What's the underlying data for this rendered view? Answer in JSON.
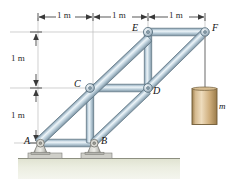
{
  "figure": {
    "colors": {
      "member_light": "#e3edf3",
      "member_mid": "#a9c0ce",
      "member_dark": "#7d95a5",
      "member_edge": "#5d7381",
      "joint_fill": "#c9d6de",
      "support_light": "#e8e8e6",
      "support_mid": "#b9b9b4",
      "support_dark": "#8d8d88",
      "ground_fill": "#e5e7d8",
      "ground_line": "#8d8f80",
      "cylinder_light": "#e2cba4",
      "cylinder_mid": "#c9a873",
      "cylinder_dark": "#9d7f4e",
      "cable": "#8c8c8c",
      "grid_line": "#b9b9b9",
      "dim_line": "#3a3a3a",
      "text": "#111111"
    }
  },
  "dimensions": {
    "horizontal": [
      {
        "label": "1 m",
        "x": 65,
        "y": 9
      },
      {
        "label": "1 m",
        "x": 122,
        "y": 9
      },
      {
        "label": "1 m",
        "x": 179,
        "y": 9
      }
    ],
    "vertical": [
      {
        "label": "1 m",
        "x": 15,
        "y": 55
      },
      {
        "label": "1 m",
        "x": 15,
        "y": 112
      }
    ]
  },
  "joints": [
    {
      "name": "A",
      "label": "A",
      "x": 38,
      "y": 143,
      "label_x": 25,
      "label_y": 137,
      "type": "pin-support"
    },
    {
      "name": "B",
      "label": "B",
      "x": 93,
      "y": 143,
      "label_x": 102,
      "label_y": 137,
      "type": "pin-support"
    },
    {
      "name": "C",
      "label": "C",
      "x": 90,
      "y": 88,
      "label_x": 75,
      "label_y": 81,
      "type": "pin-joint"
    },
    {
      "name": "D",
      "label": "D",
      "x": 148,
      "y": 88,
      "label_x": 155,
      "label_y": 85,
      "type": "pin-joint"
    },
    {
      "name": "E",
      "label": "E",
      "x": 148,
      "y": 32,
      "label_x": 133,
      "label_y": 25,
      "type": "pin-joint"
    },
    {
      "name": "F",
      "label": "F",
      "x": 205,
      "y": 32,
      "label_x": 213,
      "label_y": 25,
      "type": "pin-joint"
    }
  ],
  "members": [
    {
      "name": "member-A-E",
      "from": "A",
      "to": "E"
    },
    {
      "name": "member-E-F",
      "from": "E",
      "to": "F"
    },
    {
      "name": "member-A-B",
      "from": "A",
      "to": "B"
    },
    {
      "name": "member-B-D",
      "from": "B",
      "to": "D"
    },
    {
      "name": "member-D-F",
      "from": "D",
      "to": "F"
    },
    {
      "name": "member-C-D",
      "from": "C",
      "to": "D"
    },
    {
      "name": "member-C-B",
      "from": "C",
      "to": "B"
    },
    {
      "name": "member-E-D",
      "from": "E",
      "to": "D"
    }
  ],
  "load": {
    "name": "hanging-mass",
    "label": "m",
    "label_x": 216,
    "label_y": 106,
    "cable_from_x": 205,
    "cable_from_y": 36,
    "cable_to_y": 88,
    "cylinder_x": 191,
    "cylinder_y": 88,
    "cylinder_w": 26,
    "cylinder_h": 37
  },
  "ground": {
    "name": "ground",
    "y": 158,
    "height": 22,
    "x": 18,
    "width": 162
  }
}
